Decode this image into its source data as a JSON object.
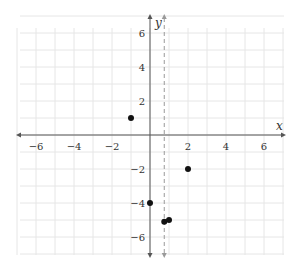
{
  "chart_data": {
    "type": "scatter",
    "title": "",
    "xlabel": "x",
    "ylabel": "y",
    "xlim": [
      -7,
      7
    ],
    "ylim": [
      -7,
      7
    ],
    "grid": true,
    "x_ticks": [
      -6,
      -4,
      -2,
      2,
      4,
      6
    ],
    "y_ticks": [
      -6,
      -4,
      -2,
      2,
      4,
      6
    ],
    "x_tick_labels": [
      "−6",
      "−4",
      "−2",
      "2",
      "4",
      "6"
    ],
    "y_tick_labels": [
      "−6",
      "−4",
      "−2",
      "2",
      "4",
      "6"
    ],
    "points": [
      {
        "x": -1,
        "y": 1
      },
      {
        "x": 0,
        "y": -4
      },
      {
        "x": 0.75,
        "y": -5.1
      },
      {
        "x": 1,
        "y": -5
      },
      {
        "x": 2,
        "y": -2
      }
    ],
    "vertical_asymptote": {
      "x": 0.75,
      "style": "dashed"
    },
    "colors": {
      "grid": "#e6e6e6",
      "axis": "#555555",
      "point": "#111111",
      "asymptote": "#999999"
    }
  }
}
